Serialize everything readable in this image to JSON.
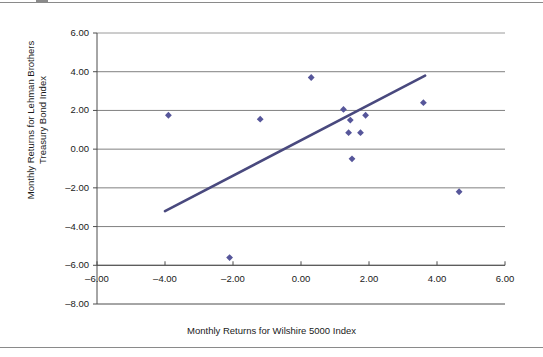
{
  "chart_data": {
    "type": "scatter",
    "title": "",
    "xlabel": "Monthly Returns for Wilshire 5000 Index",
    "ylabel": "Monthly Returns for Lehman Brothers Treasury Bond Index",
    "ylabel_line1": "Monthly Returns for Lehman Brothers",
    "ylabel_line2": "Treasury Bond Index",
    "xlim": [
      -6.0,
      6.0
    ],
    "ylim": [
      -8.0,
      6.0
    ],
    "xticks": [
      -6.0,
      -4.0,
      -2.0,
      0.0,
      2.0,
      4.0,
      6.0
    ],
    "yticks": [
      -8.0,
      -6.0,
      -4.0,
      -2.0,
      0.0,
      2.0,
      4.0,
      6.0
    ],
    "xtick_labels": [
      "–6.00",
      "–4.00",
      "–2.00",
      "0.00",
      "2.00",
      "4.00",
      "6.00"
    ],
    "ytick_labels": [
      "–8.00",
      "–6.00",
      "–4.00",
      "–2.00",
      "0.00",
      "2.00",
      "4.00",
      "6.00"
    ],
    "grid": "horizontal",
    "grid_color": "#808080",
    "legend": "none",
    "marker_color": "#56569a",
    "marker_shape": "diamond",
    "trendline_color": "#49497e",
    "points": [
      {
        "x": -3.9,
        "y": 1.75
      },
      {
        "x": -2.1,
        "y": -5.6
      },
      {
        "x": -1.2,
        "y": 1.55
      },
      {
        "x": 0.3,
        "y": 3.7
      },
      {
        "x": 1.25,
        "y": 2.05
      },
      {
        "x": 1.4,
        "y": 0.85
      },
      {
        "x": 1.45,
        "y": 1.5
      },
      {
        "x": 1.5,
        "y": -0.5
      },
      {
        "x": 1.75,
        "y": 0.85
      },
      {
        "x": 1.9,
        "y": 1.75
      },
      {
        "x": 3.6,
        "y": 2.4
      },
      {
        "x": 4.65,
        "y": -2.2
      }
    ],
    "trendline": {
      "x0": -4.0,
      "y0": -3.2,
      "x1": 3.65,
      "y1": 3.8
    }
  }
}
